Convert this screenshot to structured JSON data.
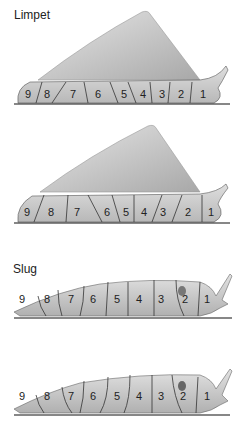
{
  "labels": {
    "limpet": "Limpet",
    "slug": "Slug"
  },
  "segments": [
    "9",
    "8",
    "7",
    "6",
    "5",
    "4",
    "3",
    "2",
    "1"
  ],
  "colors": {
    "body": "#d4d4d4",
    "shell": "#c8c8c8",
    "line": "#333333",
    "ground": "#111111"
  }
}
